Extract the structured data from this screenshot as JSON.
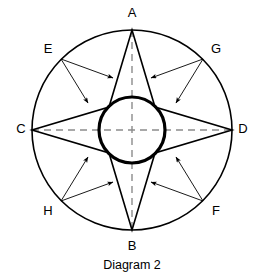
{
  "figure": {
    "caption": "Diagram 2",
    "background_color": "#ffffff",
    "stroke_color": "#000000",
    "dashed_axis_color": "#8c8c8c"
  },
  "chart_data": {
    "type": "diagram",
    "title": "Diagram 2",
    "outer_circle": {
      "cx": 132,
      "cy": 130,
      "r": 100,
      "stroke_width": 1.6
    },
    "inner_circle": {
      "cx": 132,
      "cy": 130,
      "r": 33,
      "stroke_width": 3.2
    },
    "dashed_axes": [
      {
        "name": "vertical-axis",
        "x1": 132,
        "y1": 30,
        "x2": 132,
        "y2": 230
      },
      {
        "name": "horizontal-axis",
        "x1": 32,
        "y1": 130,
        "x2": 232,
        "y2": 130
      }
    ],
    "star_points": [
      {
        "label": "A",
        "position": "top",
        "x": 132,
        "y": 30
      },
      {
        "label": "D",
        "position": "right",
        "x": 232,
        "y": 130
      },
      {
        "label": "B",
        "position": "bottom",
        "x": 132,
        "y": 230
      },
      {
        "label": "C",
        "position": "left",
        "x": 32,
        "y": 130
      }
    ],
    "star_waists": [
      {
        "name": "upper-right-waist",
        "x": 155,
        "y": 107
      },
      {
        "name": "lower-right-waist",
        "x": 155,
        "y": 153
      },
      {
        "name": "lower-left-waist",
        "x": 109,
        "y": 153
      },
      {
        "name": "upper-left-waist",
        "x": 109,
        "y": 107
      }
    ],
    "diagonal_points": [
      {
        "label": "E",
        "position": "upper-left",
        "x": 61,
        "y": 59,
        "label_x": 48,
        "label_y": 50
      },
      {
        "label": "G",
        "position": "upper-right",
        "x": 203,
        "y": 59,
        "label_x": 216,
        "label_y": 50
      },
      {
        "label": "H",
        "position": "lower-left",
        "x": 61,
        "y": 201,
        "label_x": 48,
        "label_y": 212
      },
      {
        "label": "F",
        "position": "lower-right",
        "x": 203,
        "y": 201,
        "label_x": 216,
        "label_y": 212
      }
    ],
    "arrows": [
      {
        "from": "E",
        "x1": 61,
        "y1": 59,
        "x2": 113,
        "y2": 78
      },
      {
        "from": "E",
        "x1": 61,
        "y1": 59,
        "x2": 88,
        "y2": 103
      },
      {
        "from": "G",
        "x1": 203,
        "y1": 59,
        "x2": 151,
        "y2": 78
      },
      {
        "from": "G",
        "x1": 203,
        "y1": 59,
        "x2": 176,
        "y2": 103
      },
      {
        "from": "H",
        "x1": 61,
        "y1": 201,
        "x2": 113,
        "y2": 182
      },
      {
        "from": "H",
        "x1": 61,
        "y1": 201,
        "x2": 88,
        "y2": 157
      },
      {
        "from": "F",
        "x1": 203,
        "y1": 201,
        "x2": 151,
        "y2": 182
      },
      {
        "from": "F",
        "x1": 203,
        "y1": 201,
        "x2": 176,
        "y2": 157
      }
    ],
    "vertex_labels": [
      {
        "label": "A",
        "x": 132,
        "y": 14
      },
      {
        "label": "E",
        "x": 48,
        "y": 50
      },
      {
        "label": "G",
        "x": 216,
        "y": 50
      },
      {
        "label": "C",
        "x": 21,
        "y": 130
      },
      {
        "label": "D",
        "x": 243,
        "y": 130
      },
      {
        "label": "H",
        "x": 48,
        "y": 212
      },
      {
        "label": "F",
        "x": 216,
        "y": 212
      },
      {
        "label": "B",
        "x": 132,
        "y": 247
      }
    ],
    "caption_label": {
      "text": "Diagram 2",
      "x": 132,
      "y": 266
    }
  }
}
